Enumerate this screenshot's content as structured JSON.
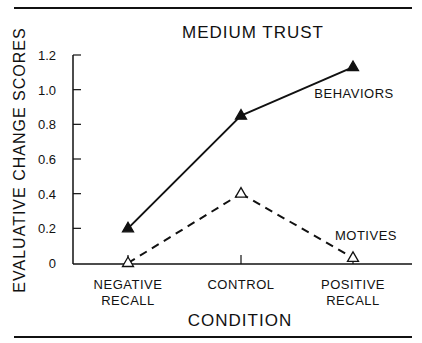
{
  "chart_data": {
    "type": "line",
    "title": "MEDIUM TRUST",
    "xlabel": "CONDITION",
    "ylabel": "EVALUATIVE CHANGE SCORES",
    "categories": [
      [
        "NEGATIVE",
        "RECALL"
      ],
      [
        "CONTROL"
      ],
      [
        "POSITIVE",
        "RECALL"
      ]
    ],
    "ylim": [
      0,
      1.2
    ],
    "yticks": [
      0,
      0.2,
      0.4,
      0.6,
      0.8,
      1.0,
      1.2
    ],
    "ytick_labels": [
      "0",
      "0.2",
      "0.4",
      "0.6",
      "0.8",
      "1.0",
      "1.2"
    ],
    "grid": false,
    "legend": "inline labels next to series",
    "series": [
      {
        "name": "BEHAVIORS",
        "values": [
          0.2,
          0.85,
          1.13
        ],
        "marker": "filled-triangle",
        "line_style": "solid",
        "color": "#111111"
      },
      {
        "name": "MOTIVES",
        "values": [
          0.0,
          0.4,
          0.03
        ],
        "marker": "open-triangle",
        "line_style": "dashed",
        "color": "#111111"
      }
    ]
  }
}
